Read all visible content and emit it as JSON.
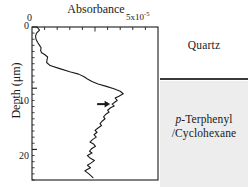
{
  "figure": {
    "background_color": "#ffffff",
    "ink_color": "#1a1a1a"
  },
  "sample": {
    "quartz_label": "Quartz",
    "solution_label_prefix": "p",
    "solution_label_line1": "-Terphenyl",
    "solution_label_line2": "/Cyclohexane",
    "interface_color": "#3a3a3a",
    "solution_fill_color": "#ededed"
  },
  "chart_data": {
    "type": "line",
    "title": "Absorbance",
    "xlabel": "Absorbance",
    "ylabel": "Depth (μm)",
    "x_tick_labels": [
      "0",
      "5x10"
    ],
    "x_tick_exponent": "-5",
    "x_axis_position": "top",
    "xlim": [
      0,
      5e-05
    ],
    "ylim": [
      0,
      25
    ],
    "y_inverted": true,
    "y_tick_labels": [
      "0",
      "10",
      "20"
    ],
    "y_ticks": [
      0,
      10,
      20
    ],
    "grid": false,
    "legend": "none",
    "annotation": {
      "type": "arrow",
      "direction": "right",
      "x": 3.1e-05,
      "y": 12.6,
      "label": ""
    },
    "series": [
      {
        "name": "Absorbance vs depth",
        "color": "#1a1a1a",
        "x": [
          2e-06,
          3e-06,
          1.8e-06,
          1.4e-06,
          1.6e-06,
          2.2e-06,
          3e-06,
          3.6e-06,
          3.4e-06,
          3.8e-06,
          5e-06,
          6.2e-06,
          6e-06,
          5.8e-06,
          7.2e-06,
          1.1e-05,
          1.5e-05,
          1.85e-05,
          2.05e-05,
          2.2e-05,
          2.38e-05,
          2.62e-05,
          2.95e-05,
          3.25e-05,
          3.5e-05,
          3.62e-05,
          3.45e-05,
          3.3e-05,
          3.38e-05,
          3.28e-05,
          3.18e-05,
          3.26e-05,
          3.12e-05,
          3e-05,
          3.06e-05,
          2.92e-05,
          2.84e-05,
          2.9e-05,
          2.78e-05,
          2.7e-05,
          2.76e-05,
          2.62e-05,
          2.5e-05,
          2.58e-05,
          2.46e-05,
          2.55e-05,
          2.4e-05,
          2.3e-05,
          2.44e-05,
          2.52e-05,
          2.36e-05,
          2.28e-05,
          2.38e-05,
          2.2e-05,
          2.3e-05,
          2.48e-05,
          2.35e-05,
          2.2e-05,
          2.32e-05,
          2.1e-05,
          2.26e-05,
          2.42e-05
        ],
        "y": [
          0.0,
          0.5,
          1.0,
          1.5,
          2.0,
          2.5,
          3.0,
          3.4,
          3.8,
          4.2,
          4.5,
          4.9,
          5.3,
          5.8,
          6.3,
          6.8,
          7.3,
          7.7,
          8.1,
          8.5,
          8.9,
          9.3,
          9.7,
          10.1,
          10.5,
          10.9,
          11.3,
          11.6,
          12.0,
          12.3,
          12.6,
          12.9,
          13.2,
          13.6,
          13.9,
          14.3,
          14.7,
          15.0,
          15.4,
          15.8,
          16.1,
          16.5,
          16.9,
          17.2,
          17.6,
          18.0,
          18.4,
          18.8,
          19.1,
          19.5,
          19.9,
          20.3,
          20.6,
          21.0,
          21.4,
          21.8,
          22.2,
          22.6,
          23.0,
          23.5,
          24.0,
          24.6
        ]
      }
    ]
  }
}
